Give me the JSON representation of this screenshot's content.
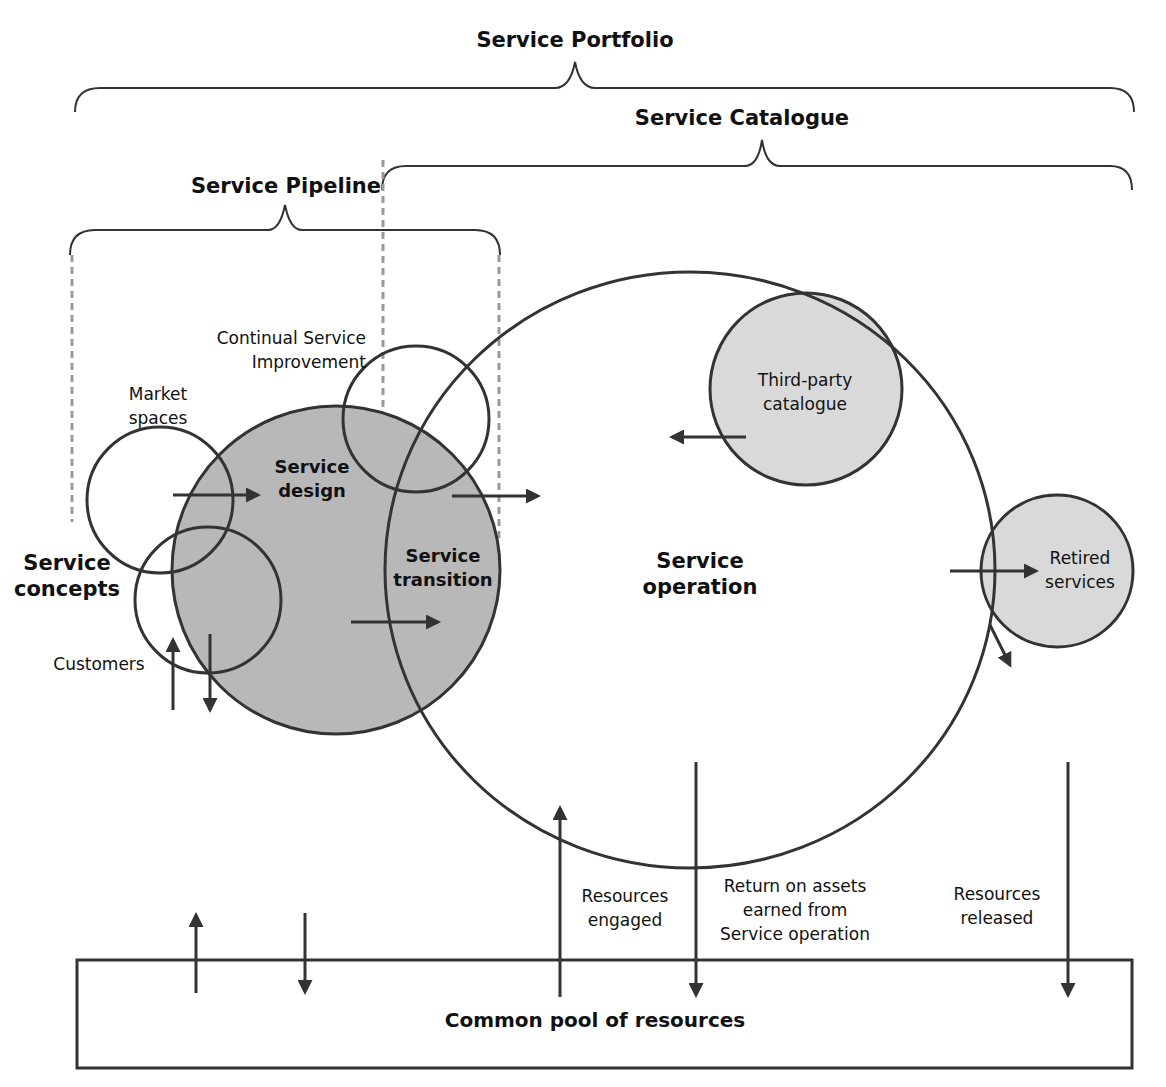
{
  "diagram": {
    "brackets": {
      "portfolio": "Service Portfolio",
      "catalogue": "Service Catalogue",
      "pipeline": "Service Pipeline"
    },
    "nodes": {
      "service_concepts": [
        "Service",
        "concepts"
      ],
      "market_spaces": [
        "Market",
        "spaces"
      ],
      "customers": "Customers",
      "csi": [
        "Continual Service",
        "Improvement"
      ],
      "service_design": [
        "Service",
        "design"
      ],
      "service_transition": [
        "Service",
        "transition"
      ],
      "service_operation": [
        "Service",
        "operation"
      ],
      "third_party": [
        "Third-party",
        "catalogue"
      ],
      "retired": [
        "Retired",
        "services"
      ]
    },
    "flows": {
      "resources_engaged": [
        "Resources",
        "engaged"
      ],
      "return_on_assets": [
        "Return on assets",
        "earned from",
        "Service operation"
      ],
      "resources_released": [
        "Resources",
        "released"
      ]
    },
    "pool": "Common pool of resources",
    "colors": {
      "stroke": "#333333",
      "shade_dark": "#b4b4b4",
      "shade_light": "#d9d9d9",
      "dashed": "#999999"
    }
  }
}
